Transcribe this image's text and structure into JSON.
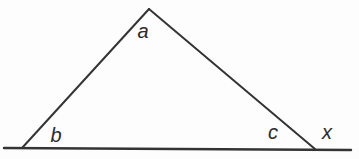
{
  "figure": {
    "kind": "geometry-diagram",
    "background_color": "#fdfdfd",
    "line_color": "#343434",
    "label_color": "#2b2b2b",
    "line_width": 2,
    "base_line_width": 2.4,
    "canvas": {
      "width": 359,
      "height": 159
    },
    "triangle": {
      "apex": {
        "x": 149,
        "y": 9
      },
      "base_left": {
        "x": 22,
        "y": 148
      },
      "base_right": {
        "x": 315,
        "y": 149
      }
    },
    "base_extension_line": {
      "x1": 4,
      "y1": 148,
      "x2": 351,
      "y2": 150
    },
    "angle_labels": {
      "a": {
        "text": "a",
        "x": 143,
        "y": 38,
        "position": "interior-apex"
      },
      "b": {
        "text": "b",
        "x": 56,
        "y": 142,
        "position": "interior-bottom-left"
      },
      "c": {
        "text": "c",
        "x": 273,
        "y": 139,
        "position": "interior-bottom-right"
      },
      "x": {
        "text": "x",
        "x": 327,
        "y": 139,
        "position": "exterior-bottom-right"
      }
    }
  }
}
